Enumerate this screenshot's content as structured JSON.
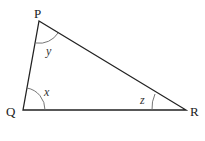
{
  "diagram": {
    "type": "triangle",
    "vertices": [
      {
        "name": "P",
        "x": 39,
        "y": 21
      },
      {
        "name": "Q",
        "x": 23,
        "y": 110
      },
      {
        "name": "R",
        "x": 186,
        "y": 110
      }
    ],
    "angles": [
      {
        "vertex": "P",
        "label": "y"
      },
      {
        "vertex": "Q",
        "label": "x"
      },
      {
        "vertex": "R",
        "label": "z"
      }
    ],
    "colors": {
      "line": "#222222",
      "arc": "#555555"
    }
  }
}
